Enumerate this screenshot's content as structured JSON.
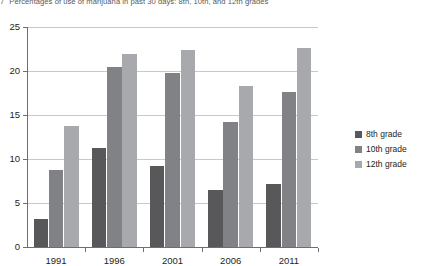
{
  "figure": {
    "number": "7",
    "title": "Percentages of use of marijuana in past 30 days: 8th, 10th, and 12th grades"
  },
  "legend": {
    "position": "right",
    "items": [
      {
        "label": "8th grade",
        "color": "#58585a"
      },
      {
        "label": "10th grade",
        "color": "#808285"
      },
      {
        "label": "12th grade",
        "color": "#a7a9ac"
      }
    ]
  },
  "axis": {
    "y_ticks": [
      "0",
      "5",
      "10",
      "15",
      "20",
      "25"
    ],
    "x_ticks": [
      "1991",
      "1996",
      "2001",
      "2006",
      "2011"
    ]
  },
  "chart_data": {
    "type": "bar",
    "title": "Percentages of use of marijuana in past 30 days: 8th, 10th, and 12th grades",
    "xlabel": "",
    "ylabel": "",
    "categories": [
      "1991",
      "1996",
      "2001",
      "2006",
      "2011"
    ],
    "series": [
      {
        "name": "8th grade",
        "color": "#58585a",
        "values": [
          3.2,
          11.3,
          9.2,
          6.5,
          7.2
        ]
      },
      {
        "name": "10th grade",
        "color": "#808285",
        "values": [
          8.7,
          20.4,
          19.8,
          14.2,
          17.6
        ]
      },
      {
        "name": "12th grade",
        "color": "#a7a9ac",
        "values": [
          13.8,
          21.9,
          22.4,
          18.3,
          22.6
        ]
      }
    ],
    "ylim": [
      0,
      25
    ],
    "ytick_step": 5,
    "grid": "horizontal",
    "legend_position": "right"
  }
}
